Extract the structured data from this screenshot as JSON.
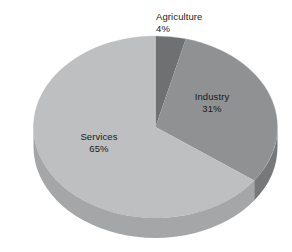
{
  "chart_data": {
    "type": "pie",
    "title": "",
    "subtitle": "",
    "xlabel": "",
    "ylabel": "",
    "legend_position": "none",
    "grid": false,
    "style": "3d-pie",
    "unit": "%",
    "categories": [
      "Agriculture",
      "Industry",
      "Services"
    ],
    "values": [
      4,
      31,
      65
    ],
    "slices": [
      {
        "label": "Agriculture",
        "value": 4,
        "value_text": "4%",
        "color": "#6e7072",
        "side_color": "#5a5c5e",
        "label_placement": "outside-top",
        "start_angle_deg": 0,
        "end_angle_deg": 14.4
      },
      {
        "label": "Industry",
        "value": 31,
        "value_text": "31%",
        "color": "#8f9192",
        "side_color": "#76787a",
        "label_placement": "inside",
        "start_angle_deg": 14.4,
        "end_angle_deg": 126.0
      },
      {
        "label": "Services",
        "value": 65,
        "value_text": "65%",
        "color": "#bdbfc0",
        "side_color": "#a4a6a7",
        "label_placement": "inside",
        "start_angle_deg": 126.0,
        "end_angle_deg": 360.0
      }
    ]
  },
  "figure": {
    "background_color": "#ffffff",
    "text_color": "#1b1b1b"
  },
  "labels": {
    "agriculture": {
      "name": "Agriculture",
      "value": "4%"
    },
    "industry": {
      "name": "Industry",
      "value": "31%"
    },
    "services": {
      "name": "Services",
      "value": "65%"
    }
  }
}
